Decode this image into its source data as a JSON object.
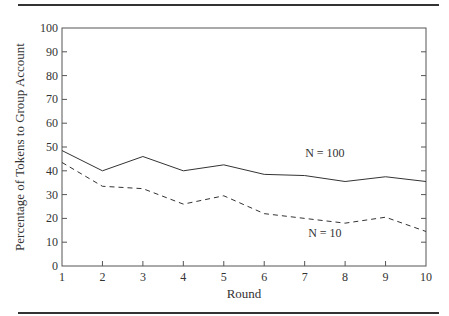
{
  "chart_data": {
    "type": "line",
    "title": "",
    "xlabel": "Round",
    "ylabel": "Percentage of Tokens to Group Account",
    "x": [
      1,
      2,
      3,
      4,
      5,
      6,
      7,
      8,
      9,
      10
    ],
    "xlim": [
      1,
      10
    ],
    "ylim": [
      0,
      100
    ],
    "xticks": [
      "1",
      "2",
      "3",
      "4",
      "5",
      "6",
      "7",
      "8",
      "9",
      "10"
    ],
    "yticks": [
      "0",
      "10",
      "20",
      "30",
      "40",
      "50",
      "60",
      "70",
      "80",
      "90",
      "100"
    ],
    "grid": false,
    "legend": "inline labels",
    "series": [
      {
        "name": "N = 100",
        "style": "solid",
        "values": [
          48.5,
          40,
          46,
          40,
          42.5,
          38.5,
          38,
          35.5,
          37.5,
          35.5
        ]
      },
      {
        "name": "N = 10",
        "style": "dashed",
        "values": [
          43.5,
          33.5,
          32.5,
          26,
          29.5,
          22,
          20,
          18,
          20.5,
          14.5
        ]
      }
    ],
    "annotations": [
      {
        "text": "N = 100",
        "series": "N = 100",
        "x": 7.5,
        "y": 46
      },
      {
        "text": "N = 10",
        "series": "N = 10",
        "x": 7.5,
        "y": 12
      }
    ]
  },
  "colors": {
    "line": "#333333",
    "axis": "#555555"
  }
}
